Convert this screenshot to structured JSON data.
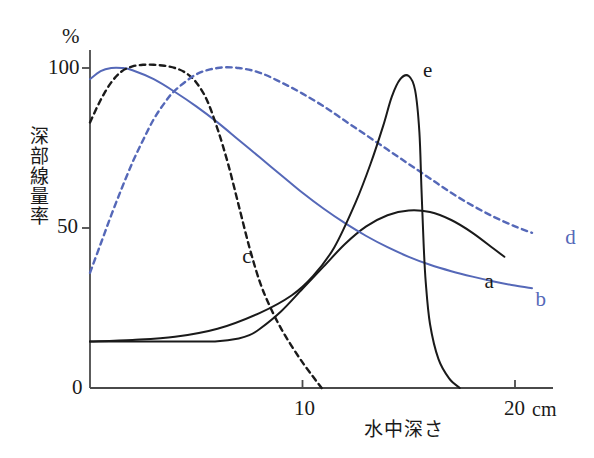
{
  "figure": {
    "background_color": "#ffffff",
    "axis_color": "#4a4a4a",
    "curve_black_color": "#1a1a1a",
    "curve_blue_color": "#5568b8"
  },
  "axes": {
    "y_unit": "%",
    "y_axis_title": "深部線量率",
    "y_ticks": [
      "100",
      "50",
      "0"
    ],
    "y_tick_values": [
      100,
      50,
      0
    ],
    "x_axis_title": "水中深さ",
    "x_ticks": [
      "10",
      "20"
    ],
    "x_tick_values": [
      10,
      20
    ],
    "x_unit": "cm"
  },
  "curve_labels": {
    "a": "a",
    "b": "b",
    "c": "c",
    "d": "d",
    "e": "e"
  },
  "chart_data": {
    "type": "line",
    "title": "",
    "subtitle": "",
    "xlabel": "水中深さ",
    "ylabel": "深部線量率",
    "xunit": "cm",
    "yunit": "%",
    "xlim": [
      0,
      22.5
    ],
    "ylim": [
      0,
      107
    ],
    "xticks": [
      10,
      20
    ],
    "yticks": [
      0,
      50,
      100
    ],
    "grid": false,
    "legend": "inline-end-labels",
    "series": [
      {
        "name": "a",
        "label": "a",
        "color": "#1a1a1a",
        "style": "solid",
        "description": "low flat entrance then broad rise and slow fall (scattered/low-energy beam)",
        "x": [
          0.0,
          1.0,
          2.0,
          3.0,
          4.0,
          5.0,
          6.0,
          7.0,
          7.5,
          8.0,
          9.0,
          10.0,
          11.0,
          12.0,
          13.0,
          14.0,
          15.0,
          16.0,
          17.0,
          18.0,
          19.0,
          19.5
        ],
        "y": [
          14.5,
          14.5,
          14.5,
          14.5,
          14.5,
          14.5,
          14.6,
          15.5,
          16.5,
          18.5,
          24.0,
          31.0,
          38.0,
          45.0,
          50.5,
          54.0,
          55.5,
          55.0,
          52.5,
          48.5,
          43.5,
          41.0
        ]
      },
      {
        "name": "b",
        "label": "b",
        "color": "#5568b8",
        "style": "solid",
        "description": "high-energy photon beam: small build-up then slow exponential fall",
        "x": [
          0.0,
          0.5,
          1.0,
          1.5,
          2.0,
          3.0,
          4.0,
          5.0,
          6.0,
          7.0,
          8.0,
          9.0,
          10.0,
          11.0,
          12.0,
          13.0,
          14.0,
          15.0,
          16.0,
          17.0,
          18.0,
          19.0,
          20.0,
          20.8
        ],
        "y": [
          96.5,
          99.0,
          100.0,
          100.0,
          99.3,
          96.5,
          92.5,
          88.0,
          83.0,
          77.5,
          72.0,
          66.5,
          61.0,
          56.0,
          51.5,
          47.5,
          44.0,
          41.0,
          38.5,
          36.5,
          34.8,
          33.3,
          32.0,
          31.2
        ]
      },
      {
        "name": "c",
        "label": "c",
        "color": "#1a1a1a",
        "style": "dashed",
        "description": "electron beam: build-up to flat maximum then steep fall to near zero by 11 cm",
        "x": [
          0.0,
          0.5,
          1.0,
          1.5,
          2.0,
          2.5,
          3.0,
          3.5,
          4.0,
          4.5,
          5.0,
          5.5,
          6.0,
          6.5,
          7.0,
          7.5,
          8.0,
          8.5,
          9.0,
          9.5,
          10.0,
          10.5,
          10.9
        ],
        "y": [
          83.0,
          90.0,
          95.5,
          99.0,
          100.5,
          101.0,
          101.0,
          100.7,
          100.0,
          98.5,
          95.5,
          90.0,
          81.0,
          70.0,
          57.0,
          44.0,
          33.0,
          25.0,
          18.5,
          13.0,
          8.0,
          3.5,
          0.0
        ]
      },
      {
        "name": "d",
        "label": "d",
        "color": "#5568b8",
        "style": "dashed",
        "description": "very high energy beam: deep build-up peak near 6-8 cm then gradual fall",
        "x": [
          0.0,
          0.5,
          1.0,
          1.5,
          2.0,
          2.5,
          3.0,
          3.5,
          4.0,
          5.0,
          6.0,
          7.0,
          8.0,
          9.0,
          10.0,
          11.0,
          12.0,
          13.0,
          14.0,
          15.0,
          16.0,
          17.0,
          18.0,
          19.0,
          20.0,
          20.8
        ],
        "y": [
          36.0,
          45.0,
          54.0,
          62.5,
          70.5,
          77.5,
          84.0,
          89.0,
          93.0,
          98.0,
          100.0,
          100.0,
          98.5,
          95.5,
          92.0,
          88.0,
          83.5,
          79.0,
          74.5,
          70.0,
          65.5,
          61.0,
          57.0,
          53.5,
          50.5,
          48.5
        ]
      },
      {
        "name": "e",
        "label": "e",
        "color": "#1a1a1a",
        "style": "solid",
        "description": "heavy particle beam: low plateau with sharp Bragg peak near 15 cm then abrupt fall to zero",
        "x": [
          0.0,
          2.0,
          4.0,
          6.0,
          8.0,
          9.5,
          10.5,
          11.5,
          12.5,
          13.2,
          13.8,
          14.2,
          14.6,
          15.0,
          15.3,
          15.5,
          15.6,
          15.7,
          15.8,
          16.0,
          16.4,
          16.9,
          17.4
        ],
        "y": [
          14.5,
          15.0,
          16.0,
          18.5,
          23.5,
          29.0,
          35.0,
          44.0,
          58.0,
          70.0,
          82.0,
          91.0,
          96.5,
          97.5,
          93.0,
          80.0,
          62.0,
          45.0,
          33.0,
          20.0,
          9.0,
          3.0,
          0.0
        ]
      }
    ],
    "label_positions": [
      {
        "name": "a",
        "x": 18.8,
        "y": 33.0
      },
      {
        "name": "b",
        "x": 21.2,
        "y": 27.5
      },
      {
        "name": "c",
        "x": 7.4,
        "y": 41.0
      },
      {
        "name": "d",
        "x": 22.6,
        "y": 47.0
      },
      {
        "name": "e",
        "x": 15.9,
        "y": 99.0
      }
    ]
  }
}
